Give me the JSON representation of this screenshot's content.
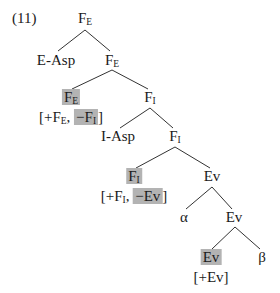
{
  "example_number": "(11)",
  "highlight_color": "#b3b3b3",
  "tree": {
    "root": {
      "base": "F",
      "sub": "E"
    },
    "e_asp": "E-Asp",
    "fe2": {
      "base": "F",
      "sub": "E"
    },
    "fe_head": {
      "base": "F",
      "sub": "E",
      "features": {
        "open": "[+F",
        "sub1": "E",
        "sep": ", ",
        "neg": "−F",
        "neg_sub": "I",
        "close": "]"
      }
    },
    "fi1": {
      "base": "F",
      "sub": "I"
    },
    "i_asp": "I-Asp",
    "fi2": {
      "base": "F",
      "sub": "I"
    },
    "fi_head": {
      "base": "F",
      "sub": "I",
      "features": {
        "open": "[+F",
        "sub1": "I",
        "sep": ", ",
        "neg": "−Ev",
        "close": "]"
      }
    },
    "ev1": "Ev",
    "alpha": "α",
    "ev2": "Ev",
    "ev_head": {
      "label": "Ev",
      "features": "[+Ev]"
    },
    "beta": "β"
  }
}
